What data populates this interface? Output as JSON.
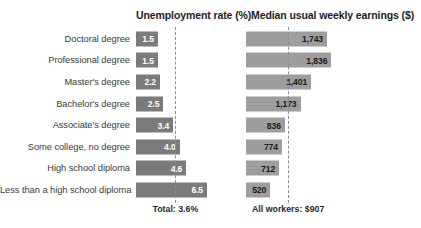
{
  "chart_data": {
    "type": "bar",
    "title": "",
    "layout": "paired horizontal bar panels, shared category axis",
    "categories": [
      "Doctoral degree",
      "Professional degree",
      "Master's degree",
      "Bachelor's degree",
      "Associate's degree",
      "Some college, no degree",
      "High school diploma",
      "Less than a high school diploma"
    ],
    "panels": [
      {
        "id": "unemployment",
        "header": "Unemployment rate (%)",
        "xlabel": "",
        "ylabel": "",
        "values": [
          1.5,
          1.5,
          2.2,
          2.5,
          3.4,
          4.0,
          4.6,
          6.5
        ],
        "value_labels": [
          "1.5",
          "1.5",
          "2.2",
          "2.5",
          "3.4",
          "4.0",
          "4.6",
          "6.5"
        ],
        "xlim": [
          0,
          7.5
        ],
        "reference_line": 3.6,
        "reference_label": "Total: 3.6%",
        "bar_color": "#7b7b7b",
        "label_color": "#ffffff",
        "grid": false
      },
      {
        "id": "earnings",
        "header": "Median usual weekly earnings ($)",
        "xlabel": "",
        "ylabel": "",
        "values": [
          1743,
          1836,
          1401,
          1173,
          836,
          774,
          712,
          520
        ],
        "value_labels": [
          "1,743",
          "1,836",
          "1,401",
          "1,173",
          "836",
          "774",
          "712",
          "520"
        ],
        "xlim": [
          0,
          2000
        ],
        "reference_line": 907,
        "reference_label": "All workers: $907",
        "bar_color": "#9e9e9e",
        "label_color": "#1b1b1b",
        "grid": false
      }
    ],
    "legend": [],
    "annotations": [
      "Total: 3.6%",
      "All workers: $907"
    ]
  },
  "colors": {
    "background": "#ffffff",
    "unemployment_bar": "#7b7b7b",
    "earnings_bar": "#9e9e9e",
    "reference_line": "#8d8d8d",
    "category_text": "#3a3a3a",
    "header_text": "#1d1d1d"
  }
}
